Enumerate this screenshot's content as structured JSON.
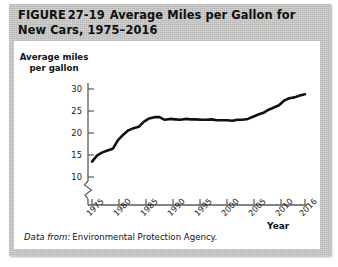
{
  "figure": {
    "label": "FIGURE",
    "number": "27-19",
    "title": "Average Miles per Gallon for New Cars, 1975–2016",
    "title_line1": "Average Miles per Gallon for New",
    "title_line2": "Cars, 1975–2016"
  },
  "source": {
    "lead": "Data from:",
    "text": "Environmental Protection Agency."
  },
  "colors": {
    "panel_background": "#c9c9c7",
    "card_background": "#ffffff",
    "line": "#111111",
    "axis": "#5a5a5a",
    "text": "#111111"
  },
  "chart_data": {
    "type": "line",
    "title": "Average Miles per Gallon for New Cars, 1975–2016",
    "xlabel": "Year",
    "ylabel": "Average miles per gallon",
    "ylabel_line1": "Average miles",
    "ylabel_line2": "per gallon",
    "xlim": [
      1975,
      2016
    ],
    "ylim": [
      8,
      31
    ],
    "y_axis_break": true,
    "grid": false,
    "legend": "none",
    "ytick_labels": [
      "10",
      "15",
      "20",
      "25",
      "30"
    ],
    "yticks": [
      10,
      15,
      20,
      25,
      30
    ],
    "xtick_labels": [
      "1975",
      "1980",
      "1985",
      "1990",
      "1995",
      "2000",
      "2005",
      "2010",
      "2016"
    ],
    "xticks": [
      1975,
      1980,
      1985,
      1990,
      1995,
      2000,
      2005,
      2010,
      2016
    ],
    "series": [
      {
        "name": "Average miles per gallon",
        "x": [
          1975,
          1976,
          1977,
          1978,
          1979,
          1980,
          1981,
          1982,
          1983,
          1984,
          1985,
          1986,
          1987,
          1988,
          1989,
          1990,
          1991,
          1992,
          1993,
          1994,
          1995,
          1996,
          1997,
          1998,
          1999,
          2000,
          2001,
          2002,
          2003,
          2004,
          2005,
          2006,
          2007,
          2008,
          2009,
          2010,
          2011,
          2012,
          2013,
          2014,
          2015,
          2016
        ],
        "values": [
          13.5,
          14.9,
          15.6,
          16.0,
          16.4,
          18.4,
          19.6,
          20.6,
          21.1,
          21.4,
          22.6,
          23.3,
          23.6,
          23.6,
          23.0,
          23.2,
          23.1,
          23.0,
          23.2,
          23.1,
          23.1,
          23.0,
          23.0,
          23.1,
          22.9,
          22.9,
          22.9,
          22.8,
          23.0,
          23.0,
          23.2,
          23.7,
          24.2,
          24.6,
          25.3,
          25.8,
          26.3,
          27.4,
          27.9,
          28.1,
          28.5,
          28.8
        ]
      }
    ]
  }
}
